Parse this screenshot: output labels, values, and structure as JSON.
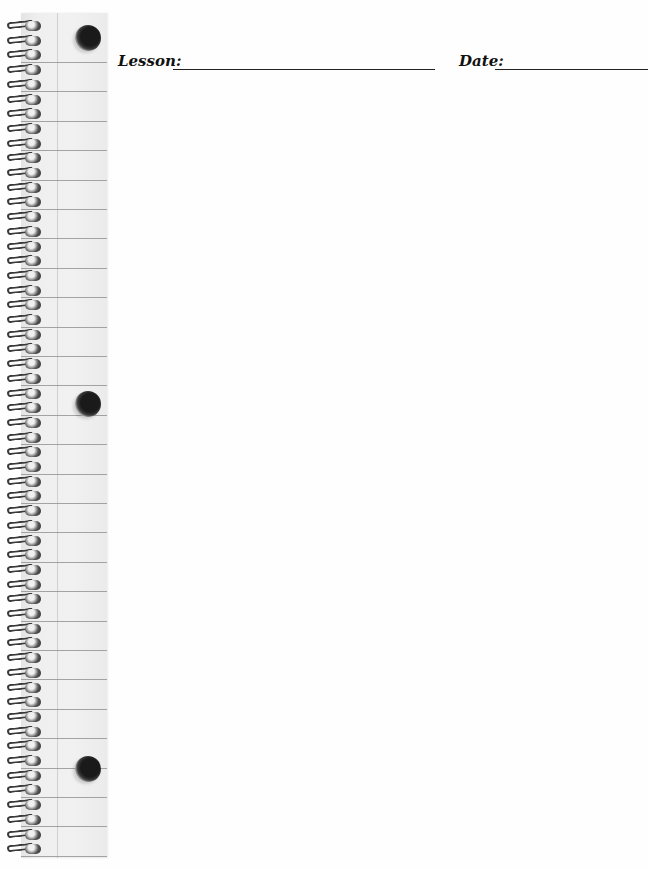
{
  "page": {
    "type": "notebook-worksheet",
    "background_color": "#fefefe",
    "rule_color": "#8a8a8a"
  },
  "header": {
    "lesson_label": "Lesson:",
    "lesson_value": "",
    "date_label": "Date:",
    "date_value": ""
  },
  "binding": {
    "spiral_count": 57,
    "binder_holes": 3,
    "rule_count": 28
  }
}
